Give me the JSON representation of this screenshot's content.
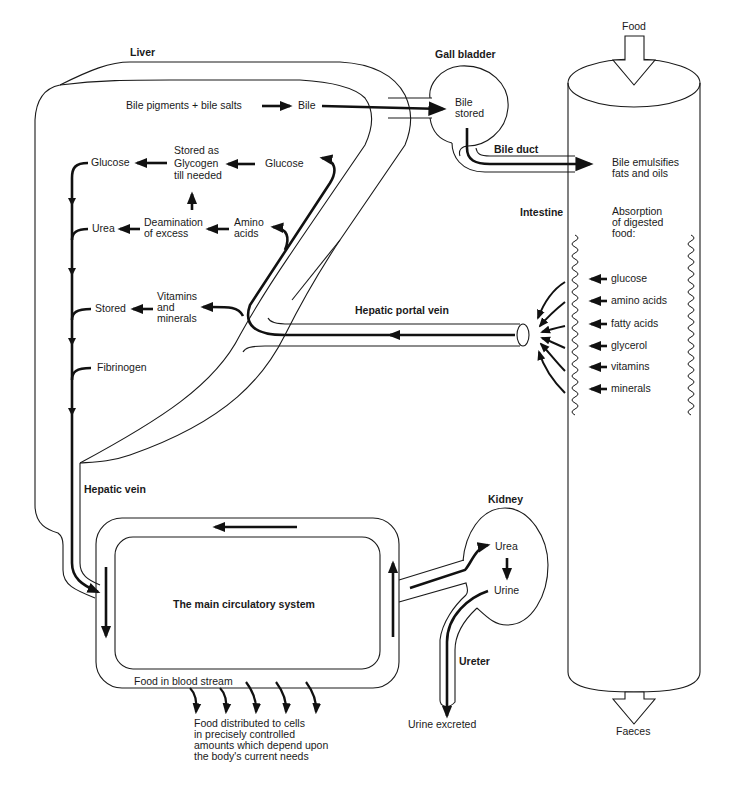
{
  "diagram": {
    "type": "flow-diagram",
    "colors": {
      "ink": "#1a1a1a",
      "background": "#ffffff"
    }
  },
  "organs": {
    "liver": "Liver",
    "gall_bladder": "Gall bladder",
    "gall_bladder_content": [
      "Bile",
      "stored"
    ],
    "bile_duct": "Bile duct",
    "intestine": "Intestine",
    "hepatic_portal_vein": "Hepatic portal vein",
    "hepatic_vein": "Hepatic vein",
    "kidney": "Kidney",
    "ureter": "Ureter",
    "circulatory_system": "The main circulatory system"
  },
  "liver_processes": {
    "bile_source": "Bile pigments + bile salts",
    "bile": "Bile",
    "glucose_in": "Glucose",
    "glycogen": [
      "Stored as",
      "Glycogen",
      "till needed"
    ],
    "glucose_out": "Glucose",
    "amino_acids": [
      "Amino",
      "acids"
    ],
    "deamination": [
      "Deamination",
      "of excess"
    ],
    "urea": "Urea",
    "vitamins_minerals": [
      "Vitamins",
      "and",
      "minerals"
    ],
    "stored": "Stored",
    "fibrinogen": "Fibrinogen"
  },
  "intestine": {
    "food_in": "Food",
    "bile_effect": [
      "Bile emulsifies",
      "fats and oils"
    ],
    "absorption": [
      "Absorption",
      "of digested",
      "food:"
    ],
    "absorbed": [
      "glucose",
      "amino acids",
      "fatty acids",
      "glycerol",
      "vitamins",
      "minerals"
    ],
    "faeces": "Faeces"
  },
  "kidney": {
    "urea": "Urea",
    "urine": "Urine",
    "urine_excreted": "Urine excreted"
  },
  "circulation": {
    "food_in_blood": "Food in blood stream",
    "distribution": [
      "Food distributed to cells",
      "in precisely controlled",
      "amounts which depend upon",
      "the body's current needs"
    ]
  }
}
